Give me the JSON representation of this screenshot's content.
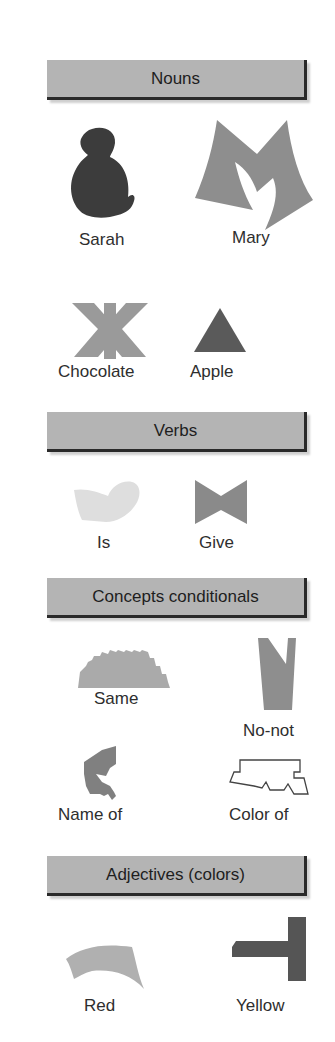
{
  "sections": [
    {
      "title": "Nouns",
      "items": [
        {
          "label": "Sarah",
          "shape": "seated-figure",
          "color": "#3c3c3c"
        },
        {
          "label": "Mary",
          "shape": "m-shape",
          "color": "#8e8e8e"
        },
        {
          "label": "Chocolate",
          "shape": "star-cross",
          "color": "#9a9a9a"
        },
        {
          "label": "Apple",
          "shape": "triangle",
          "color": "#5a5a5a"
        }
      ]
    },
    {
      "title": "Verbs",
      "items": [
        {
          "label": "Is",
          "shape": "bean",
          "color": "#dedede"
        },
        {
          "label": "Give",
          "shape": "bowtie",
          "color": "#8a8a8a"
        }
      ]
    },
    {
      "title": "Concepts conditionals",
      "items": [
        {
          "label": "Same",
          "shape": "serrated",
          "color": "#aaaaaa"
        },
        {
          "label": "No-not",
          "shape": "notched-wedge",
          "color": "#8e8e8e"
        },
        {
          "label": "Name of",
          "shape": "hook",
          "color": "#808080"
        },
        {
          "label": "Color of",
          "shape": "outline-polygon",
          "color": "#444444"
        }
      ]
    },
    {
      "title": "Adjectives (colors)",
      "items": [
        {
          "label": "Red",
          "shape": "arc",
          "color": "#b0b0b0"
        },
        {
          "label": "Yellow",
          "shape": "t-shape",
          "color": "#555555"
        }
      ]
    }
  ]
}
